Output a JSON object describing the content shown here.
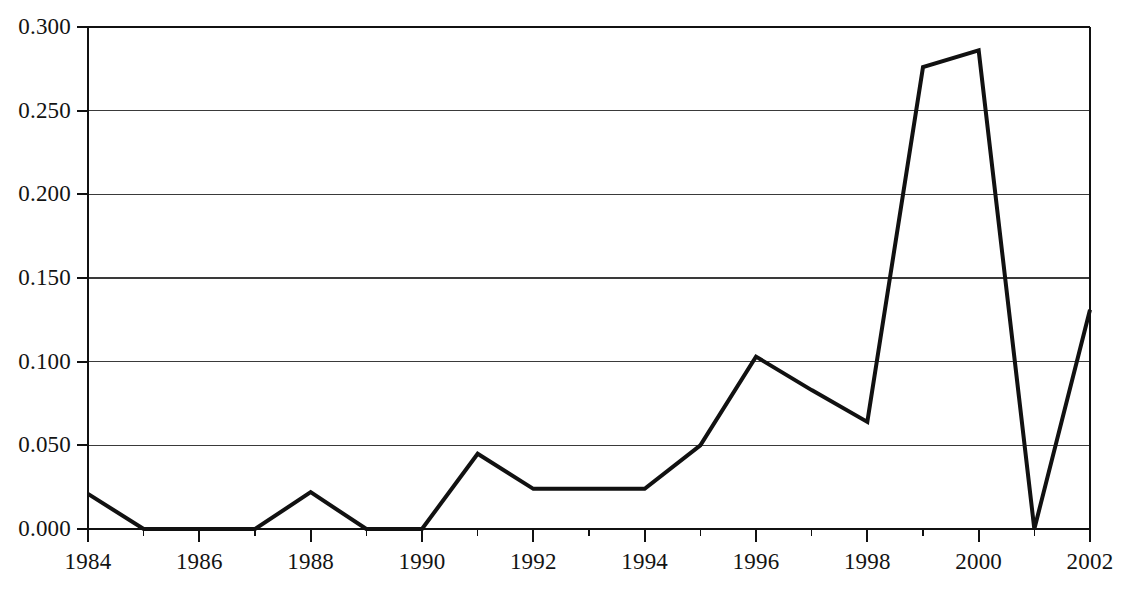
{
  "chart_data": {
    "type": "line",
    "title": "",
    "subtitle": "",
    "xlabel": "",
    "ylabel": "",
    "x": [
      1984,
      1985,
      1986,
      1987,
      1988,
      1989,
      1990,
      1991,
      1992,
      1993,
      1994,
      1995,
      1996,
      1997,
      1998,
      1999,
      2000,
      2001,
      2002
    ],
    "values": [
      0.021,
      0.0,
      0.0,
      0.0,
      0.022,
      0.0,
      0.0,
      0.045,
      0.024,
      0.024,
      0.024,
      0.05,
      0.103,
      0.083,
      0.064,
      0.276,
      0.286,
      0.0,
      0.131
    ],
    "series": [
      {
        "name": "series-1",
        "values": [
          0.021,
          0.0,
          0.0,
          0.0,
          0.022,
          0.0,
          0.0,
          0.045,
          0.024,
          0.024,
          0.024,
          0.05,
          0.103,
          0.083,
          0.064,
          0.276,
          0.286,
          0.0,
          0.131
        ]
      }
    ],
    "xlim": [
      1984,
      2002
    ],
    "ylim": [
      0.0,
      0.3
    ],
    "y_ticks": [
      0.0,
      0.05,
      0.1,
      0.15,
      0.2,
      0.25,
      0.3
    ],
    "y_tick_labels": [
      "0.000",
      "0.050",
      "0.100",
      "0.150",
      "0.200",
      "0.250",
      "0.300"
    ],
    "x_ticks": [
      1984,
      1986,
      1988,
      1990,
      1992,
      1994,
      1996,
      1998,
      2000,
      2002
    ],
    "x_tick_labels": [
      "1984",
      "1986",
      "1988",
      "1990",
      "1992",
      "1994",
      "1996",
      "1998",
      "2000",
      "2002"
    ],
    "x_minor_ticks": [
      1985,
      1987,
      1989,
      1991,
      1993,
      1995,
      1997,
      1999,
      2001
    ],
    "grid": {
      "horizontal": true,
      "vertical": false
    },
    "legend": {
      "visible": false,
      "position": "none",
      "entries": []
    },
    "annotations": [],
    "style": {
      "line_color": "#111111",
      "line_width": 4,
      "grid_color": "#3a3a3a",
      "axis_color": "#111111",
      "background": "#ffffff",
      "markers": "none"
    }
  },
  "axes": {
    "y_labels": [
      "0.300",
      "0.250",
      "0.200",
      "0.150",
      "0.100",
      "0.050",
      "0.000"
    ],
    "x_labels": [
      "1984",
      "1986",
      "1988",
      "1990",
      "1992",
      "1994",
      "1996",
      "1998",
      "2000",
      "2002"
    ]
  }
}
